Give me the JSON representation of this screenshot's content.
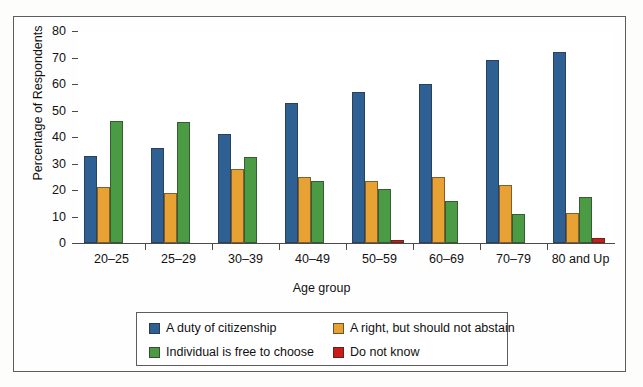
{
  "chart_data": {
    "type": "bar",
    "title": "",
    "xlabel": "Age group",
    "ylabel": "Percentage of Respondents",
    "ylim": [
      0,
      80
    ],
    "yticks": [
      0,
      10,
      20,
      30,
      40,
      50,
      60,
      70,
      80
    ],
    "grid": false,
    "legend_position": "bottom",
    "categories": [
      "20–25",
      "25–29",
      "30–39",
      "40–49",
      "50–59",
      "60–69",
      "70–79",
      "80 and Up"
    ],
    "series": [
      {
        "name": "A duty of citizenship",
        "color": "#2e6094",
        "values": [
          33,
          36,
          41,
          53,
          57,
          60,
          69,
          72
        ]
      },
      {
        "name": "A right, but should not abstain",
        "color": "#e8a233",
        "values": [
          21,
          19,
          28,
          25,
          23.5,
          25,
          22,
          11.5
        ]
      },
      {
        "name": "Individual is free to choose",
        "color": "#4b9b45",
        "values": [
          46,
          45.5,
          32.5,
          23.5,
          20.5,
          16,
          11,
          17.5
        ]
      },
      {
        "name": "Do not know",
        "color": "#cc1c17",
        "values": [
          0,
          0,
          0,
          0,
          1,
          0,
          0,
          2
        ]
      }
    ]
  },
  "axis": {
    "y_title": "Percentage of Respondents",
    "x_title": "Age group"
  }
}
